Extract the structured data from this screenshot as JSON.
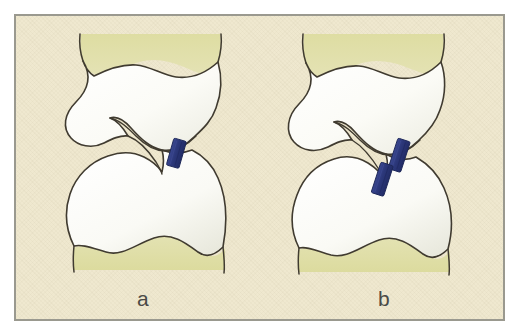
{
  "figure": {
    "type": "medical-illustration",
    "frame_border_color": "#9a998f",
    "background_color": "#efe8cf",
    "soft_tissue_color": "#dcdba4",
    "bone_fill_color": "#fbfbf7",
    "bone_outline_color": "#403b30",
    "implant_color": "#2e3b80",
    "implant_outline_color": "#1d2758",
    "label_color": "#4a4a46"
  },
  "panels": [
    {
      "id": "a",
      "label": "a",
      "description": "Anatomically reduced joint fragments with a single blue fixation implant crossing the fracture line",
      "implant_count": 1,
      "alignment": "reduced",
      "implants": [
        {
          "name": "implant-a-1",
          "x": 158,
          "y": 122,
          "width": 13,
          "height": 28,
          "rotation": 16
        }
      ]
    },
    {
      "id": "b",
      "label": "b",
      "description": "Displaced joint fragments with two blue fixation implants arranged in a staggered diagonal",
      "implant_count": 2,
      "alignment": "displaced",
      "implants": [
        {
          "name": "implant-b-1",
          "x": 382,
          "y": 122,
          "width": 13,
          "height": 32,
          "rotation": 18
        },
        {
          "name": "implant-b-2",
          "x": 369,
          "y": 145,
          "width": 13,
          "height": 32,
          "rotation": 18
        }
      ]
    }
  ],
  "labels": {
    "panel_a": "a",
    "panel_b": "b"
  }
}
